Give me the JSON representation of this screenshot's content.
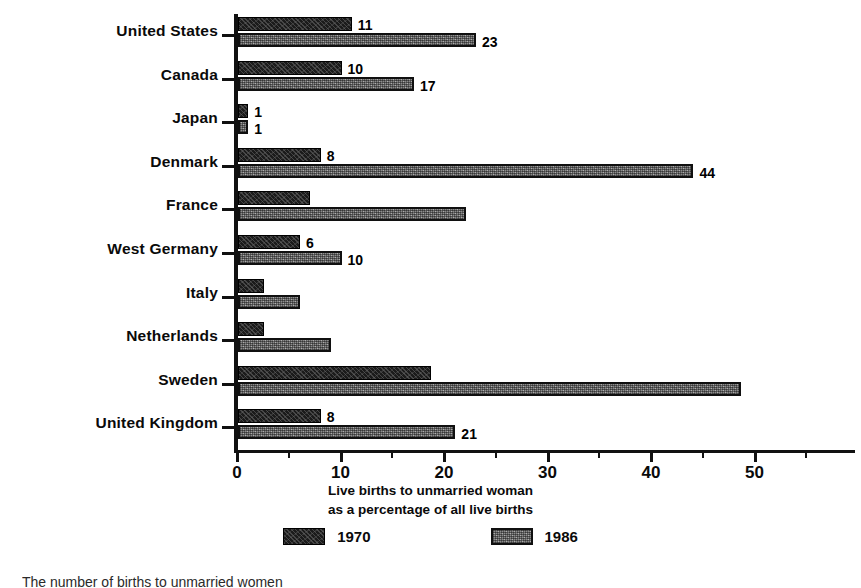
{
  "chart_data": {
    "type": "bar",
    "orientation": "horizontal",
    "title": "",
    "xlabel": "Live births to unmarried woman as a percentage of all live births",
    "xlabel_lines": [
      "Live births to unmarried woman",
      "as a percentage of all live births"
    ],
    "ylabel": "",
    "categories": [
      "United States",
      "Canada",
      "Japan",
      "Denmark",
      "France",
      "West Germany",
      "Italy",
      "Netherlands",
      "Sweden",
      "United Kingdom"
    ],
    "series": [
      {
        "name": "1970",
        "color": "#1b1b1b",
        "values": [
          11,
          10,
          1,
          8,
          7,
          6,
          2.5,
          2.5,
          18.6,
          8
        ],
        "labels": [
          "11",
          "10",
          "1",
          "8",
          "",
          "6",
          "",
          "",
          "",
          "8"
        ]
      },
      {
        "name": "1986",
        "color": "#8c8c8c",
        "values": [
          23,
          17,
          1,
          44,
          22,
          10,
          6,
          9,
          48.6,
          21
        ],
        "labels": [
          "23",
          "17",
          "1",
          "44",
          "",
          "10",
          "",
          "",
          "",
          "21"
        ]
      }
    ],
    "xlim": [
      0,
      59.5
    ],
    "xticks_major": [
      0,
      10,
      20,
      30,
      40,
      50
    ],
    "xticks_major_labels": [
      "0",
      "10",
      "20",
      "30",
      "40",
      "50"
    ],
    "xticks_minor": [
      5,
      15,
      25,
      35,
      45,
      55
    ],
    "grid": false,
    "legend_position": "bottom",
    "legend": [
      "1970",
      "1986"
    ]
  },
  "footnote": {
    "text": "The number of births to unmarried women"
  }
}
